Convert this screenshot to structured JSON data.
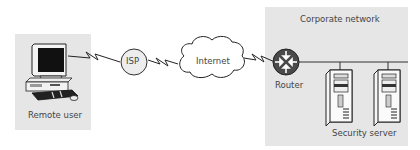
{
  "diagram": {
    "zones": {
      "remote": {
        "label": "Remote user"
      },
      "corporate": {
        "label": "Corporate network"
      }
    },
    "nodes": {
      "isp": {
        "label": "ISP"
      },
      "internet": {
        "label": "Internet"
      },
      "router": {
        "label": "Router"
      },
      "servers": {
        "label": "Security server"
      }
    },
    "colors": {
      "zone_fill": "#e6e6e6",
      "router_fill": "#4a4a4a",
      "line": "#333333",
      "node_fill": "#ededed"
    },
    "connections": [
      {
        "from": "Remote user",
        "to": "ISP",
        "type": "wan-link"
      },
      {
        "from": "ISP",
        "to": "Internet",
        "type": "wan-link"
      },
      {
        "from": "Internet",
        "to": "Router",
        "type": "wan-link"
      },
      {
        "from": "Router",
        "to": "Security server",
        "type": "lan"
      }
    ]
  }
}
